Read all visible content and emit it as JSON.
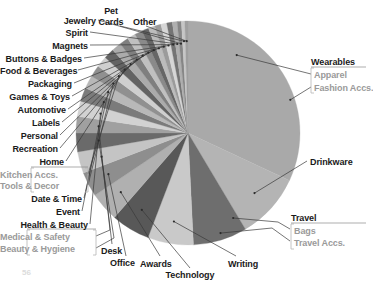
{
  "chart_data": {
    "type": "pie",
    "title": "",
    "subtitle": "",
    "xlabel": "",
    "ylabel": "",
    "legend_position": "none",
    "grid": false,
    "start_angle_deg": 0,
    "direction": "clockwise",
    "center_px": [
      188,
      133
    ],
    "radius_px": 112,
    "categories": [
      "Wearables",
      "Drinkware",
      "Travel",
      "Writing",
      "Technology",
      "Awards",
      "Office",
      "Desk",
      "Beauty & Hygiene",
      "Medical & Safety",
      "Health & Beauty",
      "Event",
      "Date & Time",
      "Tools & Decor",
      "Kitchen Accs.",
      "Home",
      "Recreation",
      "Personal",
      "Labels",
      "Automotive",
      "Games & Toys",
      "Packaging",
      "Food & Beverages",
      "Buttons & Badges",
      "Magnets",
      "Spirit",
      "Jewelry",
      "Pet Cards",
      "Other"
    ],
    "values": [
      32.0,
      9.5,
      7.8,
      6.6,
      5.6,
      4.2,
      3.6,
      3.1,
      2.7,
      2.4,
      2.2,
      2.0,
      1.9,
      1.7,
      1.6,
      1.5,
      1.4,
      1.3,
      1.2,
      1.1,
      1.0,
      0.95,
      0.9,
      0.85,
      0.8,
      0.7,
      0.6,
      0.5,
      0.45
    ],
    "colors": [
      "#a9a9a9",
      "#b4b4b4",
      "#6e6e6e",
      "#c9c9c9",
      "#585858",
      "#b0b0b0",
      "#8e8e8e",
      "#c4c4c4",
      "#6a6a6a",
      "#a0a0a0",
      "#d2d2d2",
      "#7b7b7b",
      "#b8b8b8",
      "#909090",
      "#cfcfcf",
      "#636363",
      "#ababab",
      "#7f7f7f",
      "#c0c0c0",
      "#8a8a8a",
      "#666666",
      "#bcbcbc",
      "#9b9b9b",
      "#d6d6d6",
      "#747474",
      "#afafaf",
      "#868686",
      "#c6c6c6",
      "#9f9f9f"
    ],
    "groups": [
      {
        "parent": "Wearables",
        "children": [
          "Apparel",
          "Fashion Accs."
        ]
      },
      {
        "parent": "Travel",
        "children": [
          "Bags",
          "Travel Accs."
        ]
      },
      {
        "parent": "Health & Beauty",
        "children": [
          "Medical & Safety",
          "Beauty & Hygiene"
        ]
      },
      {
        "parent": "Home",
        "children": [
          "Kitchen Accs.",
          "Tools & Decor"
        ]
      }
    ]
  },
  "labels": {
    "jewelry": "Jewelry",
    "spirit": "Spirit",
    "magnets": "Magnets",
    "buttons_badges": "Buttons & Badges",
    "food_beverages": "Food & Beverages",
    "packaging": "Packaging",
    "games_toys": "Games & Toys",
    "automotive": "Automotive",
    "labels": "Labels",
    "personal": "Personal",
    "recreation": "Recreation",
    "home": "Home",
    "kitchen_accs": "Kitchen Accs.",
    "tools_decor": "Tools & Decor",
    "date_time": "Date & Time",
    "event": "Event",
    "health_beauty": "Health & Beauty",
    "medical_safety": "Medical & Safety",
    "beauty_hygiene": "Beauty & Hygiene",
    "pet": "Pet",
    "cards": "Cards",
    "other": "Other",
    "desk": "Desk",
    "office": "Office",
    "awards": "Awards",
    "technology": "Technology",
    "writing": "Writing",
    "travel": "Travel",
    "bags": "Bags",
    "travel_accs": "Travel Accs.",
    "drinkware": "Drinkware",
    "wearables": "Wearables",
    "apparel": "Apparel",
    "fashion_accs": "Fashion Accs.",
    "corner_number": "56"
  }
}
